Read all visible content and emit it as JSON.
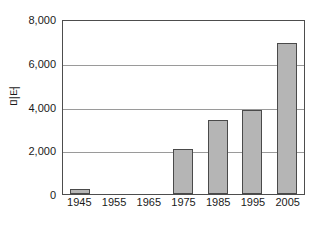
{
  "chart_data": {
    "type": "bar",
    "title": "",
    "subtitle": "",
    "xlabel": "",
    "ylabel": "미터",
    "categories": [
      "1945",
      "1955",
      "1965",
      "1975",
      "1985",
      "1995",
      "2005"
    ],
    "values": [
      230,
      0,
      0,
      2080,
      3400,
      3830,
      6900
    ],
    "series": [
      {
        "name": "",
        "values": [
          230,
          0,
          0,
          2080,
          3400,
          3830,
          6900
        ]
      }
    ],
    "ylim": [
      0,
      8000
    ],
    "y_ticks": [
      0,
      2000,
      4000,
      6000,
      8000
    ],
    "y_tick_labels": [
      "0",
      "2,000",
      "4,000",
      "6,000",
      "8,000"
    ],
    "x_tick_labels": [
      "1945",
      "1955",
      "1965",
      "1975",
      "1985",
      "1995",
      "2005"
    ],
    "grid": true,
    "grid_axis": "y",
    "legend": false,
    "legend_position": "none",
    "bar_fill_color": "#b5b5b5",
    "bar_edge_color": "#4a4a4a",
    "gridline_color": "#9a9a9a",
    "frame_color": "#4d4d4d",
    "background_color": "#ffffff",
    "text_color": "#1a1a1a"
  }
}
